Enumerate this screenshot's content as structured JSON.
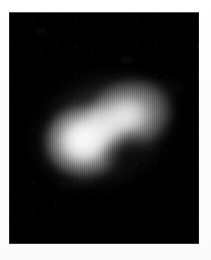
{
  "document": {
    "type": "scanned-grayscale-plate",
    "page_background": "#ffffff",
    "caption": ""
  },
  "plate": {
    "name": "image-plate",
    "background_color": "#000000",
    "x": 9,
    "y": 12,
    "width": 190,
    "height": 232,
    "border_visible": true
  },
  "object": {
    "name": "bilobed-luminous-object",
    "shape": "peanut",
    "description": "diffuse bright bilobed source with a central constriction, oriented diagonally",
    "orientation_degrees": -24,
    "bounding_box": {
      "x": 48,
      "y": 95,
      "width": 117,
      "height": 80
    },
    "peak_color": "#dedede",
    "halo_color": "#8c8c8c",
    "background_color": "#000000",
    "lobes": [
      {
        "name": "left-lobe",
        "center_x": 75,
        "center_y": 142,
        "radius_x": 39,
        "radius_y": 36,
        "peak_brightness": 222,
        "relative_intensity": 1.0
      },
      {
        "name": "right-lobe",
        "center_x": 122,
        "center_y": 114,
        "radius_x": 42,
        "radius_y": 34,
        "peak_brightness": 196,
        "relative_intensity": 0.88
      }
    ],
    "waist": {
      "name": "central-constriction",
      "center_x": 103,
      "center_y": 127,
      "relative_intensity": 0.72
    }
  },
  "texture": {
    "scanline_direction": "vertical",
    "scanline_period_px": 2,
    "grain": "film-speckle",
    "noise_level": "low"
  },
  "colors": {
    "paper": "#fdfdfd",
    "plate_black": "#000000",
    "object_peak": "#dedede",
    "object_mid": "#a8a8a8",
    "object_faint": "#464646"
  }
}
